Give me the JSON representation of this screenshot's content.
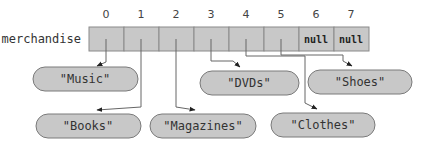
{
  "array": {
    "name": "merchandise",
    "indices": [
      "0",
      "1",
      "2",
      "3",
      "4",
      "5",
      "6",
      "7"
    ],
    "cells": [
      "",
      "",
      "",
      "",
      "",
      "",
      "null",
      "null"
    ]
  },
  "strings": {
    "music": "\"Music\"",
    "books": "\"Books\"",
    "magazines": "\"Magazines\"",
    "dvds": "\"DVDs\"",
    "clothes": "\"Clothes\"",
    "shoes": "\"Shoes\""
  },
  "colors": {
    "cell_fill": "#c8c8c8",
    "cell_stroke": "#8a8a8a",
    "pill_fill": "#c8c8c8",
    "pill_stroke": "#7a7a7a",
    "line": "#555555",
    "text": "#333333"
  }
}
